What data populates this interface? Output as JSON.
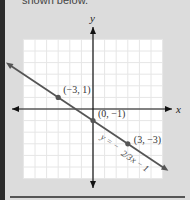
{
  "caption": "shown below.",
  "chart_data": {
    "type": "line",
    "title": "",
    "xlabel": "x",
    "ylabel": "y",
    "xlim": [
      -6,
      6
    ],
    "ylim": [
      -6,
      6
    ],
    "grid": true,
    "series": [
      {
        "name": "y = -2/3 x - 1",
        "equation": "y = −(2/3)x − 1",
        "slope": -0.6667,
        "intercept": -1,
        "x_range": [
          -7.5,
          6.5
        ]
      }
    ],
    "points": [
      {
        "x": -3,
        "y": 1,
        "label": "(−3, 1)"
      },
      {
        "x": 0,
        "y": -1,
        "label": "(0, −1)"
      },
      {
        "x": 3,
        "y": -3,
        "label": "(3, −3)"
      }
    ],
    "equation_label": "y = −",
    "equation_frac": "2/3",
    "equation_tail": "x − 1",
    "colors": {
      "line": "#555555",
      "axis": "#111111",
      "grid": "#e6e6e6",
      "plot_bg": "#ffffff"
    }
  }
}
